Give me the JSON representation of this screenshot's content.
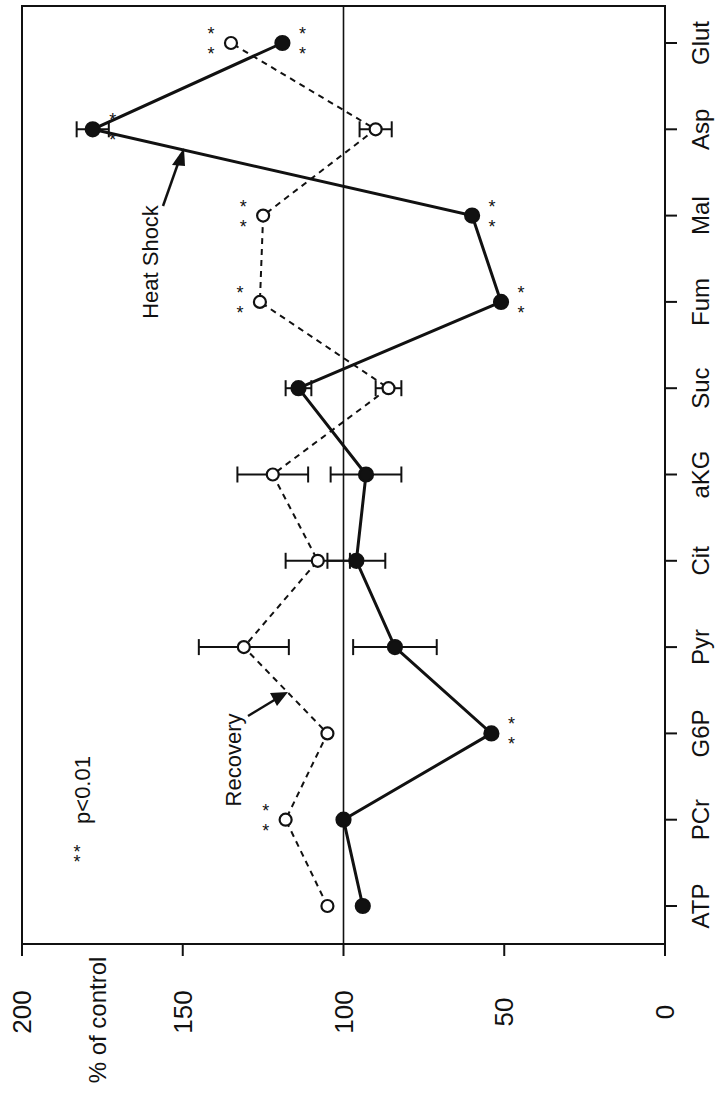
{
  "chart_data": {
    "type": "line",
    "orientation": "rotated-90",
    "title": "",
    "ylabel": "% of control",
    "xlabel": "",
    "ylim": [
      0,
      200
    ],
    "yticks": [
      0,
      50,
      100,
      150,
      200
    ],
    "reference_line": 100,
    "categories": [
      "ATP",
      "PCr",
      "G6P",
      "Pyr",
      "Cit",
      "aKG",
      "Suc",
      "Fum",
      "Mal",
      "Asp",
      "Glut"
    ],
    "series": [
      {
        "name": "Heat Shock",
        "marker": "filled-circle",
        "line": "solid",
        "values": [
          94,
          100,
          54,
          84,
          96,
          93,
          114,
          51,
          60,
          178,
          119
        ],
        "err": [
          null,
          null,
          null,
          13,
          9,
          11,
          4,
          null,
          null,
          5,
          null
        ],
        "significant": [
          false,
          false,
          true,
          false,
          false,
          false,
          false,
          true,
          true,
          true,
          true
        ]
      },
      {
        "name": "Recovery",
        "marker": "open-circle",
        "line": "dashed",
        "values": [
          105,
          118,
          105,
          131,
          108,
          122,
          86,
          126,
          125,
          90,
          135
        ],
        "err": [
          null,
          null,
          null,
          14,
          10,
          11,
          4,
          null,
          null,
          5,
          null
        ],
        "significant": [
          false,
          true,
          false,
          false,
          false,
          false,
          false,
          true,
          true,
          false,
          true
        ]
      }
    ],
    "annotations": [
      {
        "text": "Heat Shock",
        "points_to": "Heat Shock"
      },
      {
        "text": "Recovery",
        "points_to": "Recovery"
      },
      {
        "text": "p<0.01",
        "marker": "**"
      }
    ],
    "grid": false,
    "legend": "none"
  }
}
